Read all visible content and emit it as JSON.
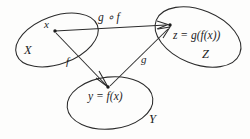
{
  "diagram": {
    "background_color": "#fdfdfc",
    "stroke_color": "#2b2b2b",
    "sets": [
      {
        "id": "X",
        "label": "X",
        "role": "domain"
      },
      {
        "id": "Y",
        "label": "Y",
        "role": "codomain-of-f"
      },
      {
        "id": "Z",
        "label": "Z",
        "role": "codomain-of-g"
      }
    ],
    "elements": [
      {
        "id": "x",
        "label": "x",
        "set": "X"
      },
      {
        "id": "y",
        "label": "y = f(x)",
        "set": "Y"
      },
      {
        "id": "z",
        "label": "z = g(f(x))",
        "set": "Z"
      }
    ],
    "arrows": [
      {
        "id": "f",
        "label": "f",
        "from": "x",
        "to": "y"
      },
      {
        "id": "g",
        "label": "g",
        "from": "y",
        "to": "z"
      },
      {
        "id": "gof",
        "label": "g ∘ f",
        "from": "x",
        "to": "z"
      }
    ]
  }
}
